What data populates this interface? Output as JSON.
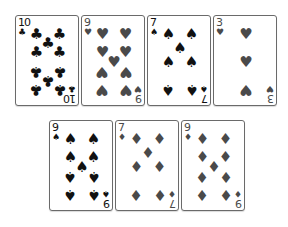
{
  "colors": {
    "black_suit": "#111111",
    "red_suit": "#4a4a4a",
    "card_border": "#6a6a6a"
  },
  "cards": [
    {
      "rank": "10",
      "suit": "clubs",
      "glyph": "♣",
      "color": "black",
      "x": 15,
      "y": 15
    },
    {
      "rank": "9",
      "suit": "hearts",
      "glyph": "♥",
      "color": "red",
      "x": 81,
      "y": 15
    },
    {
      "rank": "7",
      "suit": "spades",
      "glyph": "♠",
      "color": "black",
      "x": 147,
      "y": 15
    },
    {
      "rank": "3",
      "suit": "hearts",
      "glyph": "♥",
      "color": "red",
      "x": 213,
      "y": 15
    },
    {
      "rank": "9",
      "suit": "spades",
      "glyph": "♠",
      "color": "black",
      "x": 49,
      "y": 120
    },
    {
      "rank": "7",
      "suit": "diamonds",
      "glyph": "♦",
      "color": "red",
      "x": 115,
      "y": 120
    },
    {
      "rank": "9",
      "suit": "diamonds",
      "glyph": "♦",
      "color": "red",
      "x": 181,
      "y": 120
    }
  ]
}
